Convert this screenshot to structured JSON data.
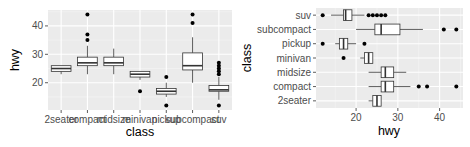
{
  "chart_data": [
    {
      "type": "boxplot",
      "orientation": "vertical",
      "title": "",
      "xlabel": "class",
      "ylabel": "hwy",
      "categories": [
        "2seater",
        "compact",
        "midsize",
        "minivan",
        "pickup",
        "subcompact",
        "suv"
      ],
      "yticks": [
        20,
        30,
        40
      ],
      "ylim": [
        10.4,
        45.6
      ],
      "grid": true,
      "background": "#ebebeb",
      "series": [
        {
          "name": "2seater",
          "min": 23,
          "q1": 24,
          "median": 25,
          "q3": 26,
          "max": 26,
          "outliers": []
        },
        {
          "name": "compact",
          "min": 23,
          "q1": 26,
          "median": 27,
          "q3": 29,
          "max": 33,
          "outliers": [
            35,
            37,
            44
          ]
        },
        {
          "name": "midsize",
          "min": 23,
          "q1": 26,
          "median": 27,
          "q3": 29,
          "max": 32,
          "outliers": []
        },
        {
          "name": "minivan",
          "min": 21,
          "q1": 22,
          "median": 23,
          "q3": 24,
          "max": 24,
          "outliers": [
            17
          ]
        },
        {
          "name": "pickup",
          "min": 15,
          "q1": 16,
          "median": 17,
          "q3": 18,
          "max": 20,
          "outliers": [
            12,
            22
          ]
        },
        {
          "name": "subcompact",
          "min": 20,
          "q1": 24.5,
          "median": 26,
          "q3": 30.5,
          "max": 36,
          "outliers": [
            41,
            44
          ]
        },
        {
          "name": "suv",
          "min": 14,
          "q1": 17,
          "median": 17.5,
          "q3": 19,
          "max": 22,
          "outliers": [
            12,
            23,
            24,
            25,
            26,
            27
          ]
        }
      ]
    },
    {
      "type": "boxplot",
      "orientation": "horizontal",
      "title": "",
      "xlabel": "hwy",
      "ylabel": "class",
      "categories": [
        "2seater",
        "compact",
        "midsize",
        "minivan",
        "pickup",
        "subcompact",
        "suv"
      ],
      "xticks": [
        20,
        30,
        40
      ],
      "xlim": [
        10.4,
        45.6
      ],
      "grid": true,
      "background": "#ebebeb",
      "series": [
        {
          "name": "2seater",
          "min": 23,
          "q1": 24,
          "median": 25,
          "q3": 26,
          "max": 26,
          "outliers": []
        },
        {
          "name": "compact",
          "min": 23,
          "q1": 26,
          "median": 27,
          "q3": 29,
          "max": 33,
          "outliers": [
            35,
            37,
            44
          ]
        },
        {
          "name": "midsize",
          "min": 23,
          "q1": 26,
          "median": 27,
          "q3": 29,
          "max": 32,
          "outliers": []
        },
        {
          "name": "minivan",
          "min": 21,
          "q1": 22,
          "median": 23,
          "q3": 24,
          "max": 24,
          "outliers": [
            17
          ]
        },
        {
          "name": "pickup",
          "min": 15,
          "q1": 16,
          "median": 17,
          "q3": 18,
          "max": 20,
          "outliers": [
            12,
            22
          ]
        },
        {
          "name": "subcompact",
          "min": 20,
          "q1": 24.5,
          "median": 26,
          "q3": 30.5,
          "max": 36,
          "outliers": [
            41,
            44
          ]
        },
        {
          "name": "suv",
          "min": 14,
          "q1": 17,
          "median": 17.5,
          "q3": 19,
          "max": 22,
          "outliers": [
            12,
            23,
            24,
            25,
            26,
            27
          ]
        }
      ]
    }
  ],
  "left_plot": {
    "ylabel": "hwy",
    "xlabel": "class",
    "yticks": [
      "20",
      "30",
      "40"
    ],
    "xticks": [
      "2seater",
      "compact",
      "midsize",
      "minivan",
      "pickup",
      "subcompact",
      "suv"
    ]
  },
  "right_plot": {
    "ylabel": "class",
    "xlabel": "hwy",
    "xticks": [
      "20",
      "30",
      "40"
    ],
    "yticks": [
      "suv",
      "subcompact",
      "pickup",
      "minivan",
      "midsize",
      "compact",
      "2seater"
    ]
  }
}
